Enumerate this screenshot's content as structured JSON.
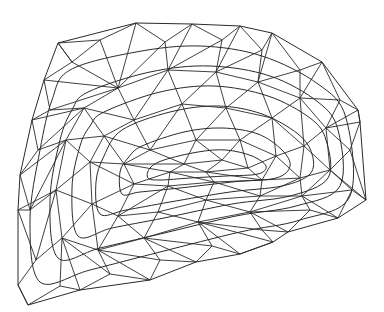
{
  "diagram": {
    "type": "triangulated-mesh-with-contours",
    "background": "#ffffff",
    "stroke_color": "#2a2a2a",
    "boundary": [
      [
        58,
        43
      ],
      [
        136,
        23
      ],
      [
        192,
        24
      ],
      [
        240,
        26
      ],
      [
        272,
        33
      ],
      [
        322,
        62
      ],
      [
        358,
        110
      ],
      [
        360,
        122
      ],
      [
        366,
        200
      ],
      [
        338,
        218
      ],
      [
        288,
        232
      ],
      [
        273,
        242
      ],
      [
        240,
        254
      ],
      [
        196,
        262
      ],
      [
        150,
        280
      ],
      [
        80,
        290
      ],
      [
        28,
        305
      ],
      [
        18,
        285
      ],
      [
        18,
        210
      ],
      [
        20,
        175
      ],
      [
        32,
        120
      ],
      [
        44,
        80
      ]
    ],
    "contours": [
      [
        [
          70,
          70
        ],
        [
          136,
          52
        ],
        [
          200,
          46
        ],
        [
          262,
          56
        ],
        [
          318,
          84
        ],
        [
          346,
          118
        ],
        [
          350,
          196
        ],
        [
          300,
          220
        ],
        [
          240,
          232
        ],
        [
          160,
          252
        ],
        [
          90,
          270
        ],
        [
          40,
          282
        ],
        [
          30,
          220
        ],
        [
          40,
          150
        ],
        [
          52,
          100
        ]
      ],
      [
        [
          88,
          92
        ],
        [
          150,
          72
        ],
        [
          210,
          66
        ],
        [
          270,
          76
        ],
        [
          318,
          102
        ],
        [
          338,
          130
        ],
        [
          340,
          186
        ],
        [
          296,
          206
        ],
        [
          236,
          216
        ],
        [
          160,
          234
        ],
        [
          100,
          248
        ],
        [
          58,
          258
        ],
        [
          50,
          200
        ],
        [
          60,
          140
        ],
        [
          72,
          110
        ]
      ],
      [
        [
          104,
          112
        ],
        [
          160,
          92
        ],
        [
          214,
          86
        ],
        [
          268,
          96
        ],
        [
          310,
          118
        ],
        [
          326,
          140
        ],
        [
          328,
          178
        ],
        [
          290,
          196
        ],
        [
          232,
          204
        ],
        [
          164,
          218
        ],
        [
          112,
          228
        ],
        [
          78,
          236
        ],
        [
          72,
          188
        ],
        [
          80,
          146
        ],
        [
          90,
          126
        ]
      ],
      [
        [
          122,
          130
        ],
        [
          170,
          112
        ],
        [
          218,
          106
        ],
        [
          262,
          114
        ],
        [
          298,
          134
        ],
        [
          312,
          154
        ],
        [
          310,
          174
        ],
        [
          282,
          186
        ],
        [
          230,
          192
        ],
        [
          170,
          202
        ],
        [
          126,
          210
        ],
        [
          100,
          214
        ],
        [
          96,
          182
        ],
        [
          104,
          156
        ]
      ],
      [
        [
          142,
          146
        ],
        [
          184,
          132
        ],
        [
          222,
          128
        ],
        [
          258,
          134
        ],
        [
          282,
          150
        ],
        [
          290,
          166
        ],
        [
          276,
          178
        ],
        [
          232,
          182
        ],
        [
          180,
          188
        ],
        [
          140,
          192
        ],
        [
          122,
          194
        ],
        [
          120,
          172
        ],
        [
          128,
          158
        ]
      ],
      [
        [
          164,
          160
        ],
        [
          198,
          152
        ],
        [
          226,
          150
        ],
        [
          252,
          156
        ],
        [
          266,
          166
        ],
        [
          258,
          174
        ],
        [
          226,
          176
        ],
        [
          190,
          178
        ],
        [
          160,
          180
        ],
        [
          148,
          178
        ],
        [
          150,
          168
        ]
      ]
    ],
    "nodes": [
      [
        58,
        43
      ],
      [
        136,
        23
      ],
      [
        192,
        24
      ],
      [
        240,
        26
      ],
      [
        272,
        33
      ],
      [
        322,
        62
      ],
      [
        358,
        110
      ],
      [
        360,
        122
      ],
      [
        366,
        200
      ],
      [
        338,
        218
      ],
      [
        288,
        232
      ],
      [
        273,
        242
      ],
      [
        240,
        254
      ],
      [
        196,
        262
      ],
      [
        150,
        280
      ],
      [
        80,
        290
      ],
      [
        28,
        305
      ],
      [
        18,
        285
      ],
      [
        18,
        210
      ],
      [
        20,
        175
      ],
      [
        32,
        120
      ],
      [
        44,
        80
      ],
      [
        100,
        40
      ],
      [
        165,
        42
      ],
      [
        222,
        40
      ],
      [
        262,
        50
      ],
      [
        300,
        70
      ],
      [
        340,
        100
      ],
      [
        350,
        150
      ],
      [
        352,
        190
      ],
      [
        310,
        210
      ],
      [
        262,
        230
      ],
      [
        212,
        246
      ],
      [
        160,
        260
      ],
      [
        110,
        274
      ],
      [
        60,
        286
      ],
      [
        36,
        260
      ],
      [
        30,
        210
      ],
      [
        38,
        150
      ],
      [
        50,
        110
      ],
      [
        72,
        62
      ],
      [
        118,
        88
      ],
      [
        168,
        70
      ],
      [
        216,
        72
      ],
      [
        258,
        82
      ],
      [
        300,
        98
      ],
      [
        326,
        128
      ],
      [
        330,
        170
      ],
      [
        302,
        196
      ],
      [
        250,
        212
      ],
      [
        198,
        222
      ],
      [
        144,
        238
      ],
      [
        98,
        250
      ],
      [
        62,
        238
      ],
      [
        56,
        190
      ],
      [
        66,
        140
      ],
      [
        84,
        108
      ],
      [
        134,
        120
      ],
      [
        182,
        104
      ],
      [
        226,
        108
      ],
      [
        272,
        118
      ],
      [
        304,
        146
      ],
      [
        300,
        178
      ],
      [
        260,
        196
      ],
      [
        206,
        200
      ],
      [
        158,
        212
      ],
      [
        118,
        216
      ],
      [
        92,
        204
      ],
      [
        90,
        162
      ],
      [
        104,
        136
      ],
      [
        150,
        150
      ],
      [
        196,
        140
      ],
      [
        240,
        140
      ],
      [
        276,
        156
      ],
      [
        262,
        180
      ],
      [
        214,
        182
      ],
      [
        168,
        186
      ],
      [
        134,
        184
      ],
      [
        124,
        164
      ],
      [
        184,
        164
      ],
      [
        222,
        160
      ],
      [
        248,
        168
      ],
      [
        206,
        172
      ],
      [
        170,
        172
      ]
    ],
    "edges": [
      [
        0,
        22
      ],
      [
        22,
        1
      ],
      [
        1,
        23
      ],
      [
        23,
        2
      ],
      [
        2,
        24
      ],
      [
        24,
        3
      ],
      [
        3,
        25
      ],
      [
        25,
        4
      ],
      [
        4,
        26
      ],
      [
        26,
        5
      ],
      [
        5,
        27
      ],
      [
        27,
        6
      ],
      [
        6,
        7
      ],
      [
        7,
        28
      ],
      [
        28,
        8
      ],
      [
        8,
        29
      ],
      [
        29,
        9
      ],
      [
        9,
        30
      ],
      [
        30,
        10
      ],
      [
        10,
        31
      ],
      [
        31,
        11
      ],
      [
        11,
        12
      ],
      [
        12,
        32
      ],
      [
        32,
        13
      ],
      [
        13,
        33
      ],
      [
        33,
        14
      ],
      [
        14,
        34
      ],
      [
        34,
        15
      ],
      [
        15,
        35
      ],
      [
        35,
        16
      ],
      [
        16,
        17
      ],
      [
        17,
        36
      ],
      [
        36,
        18
      ],
      [
        18,
        37
      ],
      [
        37,
        19
      ],
      [
        19,
        38
      ],
      [
        38,
        20
      ],
      [
        20,
        39
      ],
      [
        39,
        21
      ],
      [
        21,
        40
      ],
      [
        40,
        0
      ],
      [
        0,
        40
      ],
      [
        22,
        40
      ],
      [
        22,
        41
      ],
      [
        1,
        41
      ],
      [
        23,
        41
      ],
      [
        23,
        42
      ],
      [
        2,
        42
      ],
      [
        24,
        42
      ],
      [
        24,
        43
      ],
      [
        3,
        43
      ],
      [
        25,
        43
      ],
      [
        25,
        44
      ],
      [
        4,
        44
      ],
      [
        26,
        44
      ],
      [
        26,
        45
      ],
      [
        5,
        45
      ],
      [
        27,
        45
      ],
      [
        27,
        46
      ],
      [
        6,
        46
      ],
      [
        7,
        46
      ],
      [
        28,
        46
      ],
      [
        28,
        47
      ],
      [
        8,
        47
      ],
      [
        29,
        47
      ],
      [
        29,
        48
      ],
      [
        9,
        48
      ],
      [
        30,
        48
      ],
      [
        30,
        49
      ],
      [
        10,
        49
      ],
      [
        31,
        49
      ],
      [
        31,
        50
      ],
      [
        11,
        50
      ],
      [
        12,
        50
      ],
      [
        32,
        50
      ],
      [
        32,
        51
      ],
      [
        13,
        51
      ],
      [
        33,
        51
      ],
      [
        33,
        52
      ],
      [
        14,
        52
      ],
      [
        34,
        52
      ],
      [
        34,
        53
      ],
      [
        15,
        53
      ],
      [
        35,
        53
      ],
      [
        36,
        53
      ],
      [
        36,
        54
      ],
      [
        18,
        54
      ],
      [
        37,
        54
      ],
      [
        37,
        55
      ],
      [
        19,
        55
      ],
      [
        38,
        55
      ],
      [
        38,
        56
      ],
      [
        20,
        56
      ],
      [
        39,
        56
      ],
      [
        39,
        41
      ],
      [
        21,
        41
      ],
      [
        40,
        41
      ],
      [
        41,
        42
      ],
      [
        42,
        43
      ],
      [
        43,
        44
      ],
      [
        44,
        45
      ],
      [
        45,
        46
      ],
      [
        46,
        47
      ],
      [
        47,
        48
      ],
      [
        48,
        49
      ],
      [
        49,
        50
      ],
      [
        50,
        51
      ],
      [
        51,
        52
      ],
      [
        52,
        53
      ],
      [
        53,
        54
      ],
      [
        54,
        55
      ],
      [
        55,
        56
      ],
      [
        56,
        41
      ],
      [
        41,
        57
      ],
      [
        42,
        57
      ],
      [
        42,
        58
      ],
      [
        43,
        58
      ],
      [
        43,
        59
      ],
      [
        44,
        59
      ],
      [
        44,
        60
      ],
      [
        45,
        60
      ],
      [
        45,
        61
      ],
      [
        46,
        61
      ],
      [
        47,
        61
      ],
      [
        47,
        62
      ],
      [
        48,
        62
      ],
      [
        48,
        63
      ],
      [
        49,
        63
      ],
      [
        49,
        64
      ],
      [
        50,
        64
      ],
      [
        50,
        65
      ],
      [
        51,
        65
      ],
      [
        51,
        66
      ],
      [
        52,
        66
      ],
      [
        52,
        67
      ],
      [
        53,
        67
      ],
      [
        54,
        67
      ],
      [
        54,
        68
      ],
      [
        55,
        68
      ],
      [
        55,
        69
      ],
      [
        56,
        69
      ],
      [
        56,
        57
      ],
      [
        57,
        58
      ],
      [
        58,
        59
      ],
      [
        59,
        60
      ],
      [
        60,
        61
      ],
      [
        61,
        62
      ],
      [
        62,
        63
      ],
      [
        63,
        64
      ],
      [
        64,
        65
      ],
      [
        65,
        66
      ],
      [
        66,
        67
      ],
      [
        67,
        68
      ],
      [
        68,
        69
      ],
      [
        69,
        57
      ],
      [
        57,
        70
      ],
      [
        58,
        70
      ],
      [
        58,
        71
      ],
      [
        59,
        71
      ],
      [
        59,
        72
      ],
      [
        60,
        72
      ],
      [
        60,
        73
      ],
      [
        61,
        73
      ],
      [
        62,
        73
      ],
      [
        62,
        74
      ],
      [
        63,
        74
      ],
      [
        63,
        75
      ],
      [
        64,
        75
      ],
      [
        64,
        76
      ],
      [
        65,
        76
      ],
      [
        66,
        76
      ],
      [
        66,
        77
      ],
      [
        67,
        77
      ],
      [
        68,
        77
      ],
      [
        68,
        78
      ],
      [
        69,
        78
      ],
      [
        69,
        70
      ],
      [
        70,
        71
      ],
      [
        71,
        72
      ],
      [
        72,
        73
      ],
      [
        73,
        74
      ],
      [
        74,
        75
      ],
      [
        75,
        76
      ],
      [
        76,
        77
      ],
      [
        77,
        78
      ],
      [
        78,
        70
      ],
      [
        70,
        79
      ],
      [
        71,
        79
      ],
      [
        71,
        80
      ],
      [
        72,
        80
      ],
      [
        72,
        81
      ],
      [
        73,
        81
      ],
      [
        74,
        81
      ],
      [
        74,
        82
      ],
      [
        75,
        82
      ],
      [
        75,
        83
      ],
      [
        76,
        83
      ],
      [
        77,
        83
      ],
      [
        78,
        83
      ],
      [
        78,
        79
      ],
      [
        79,
        80
      ],
      [
        80,
        81
      ],
      [
        81,
        82
      ],
      [
        82,
        83
      ],
      [
        83,
        79
      ],
      [
        79,
        82
      ],
      [
        80,
        82
      ]
    ]
  }
}
